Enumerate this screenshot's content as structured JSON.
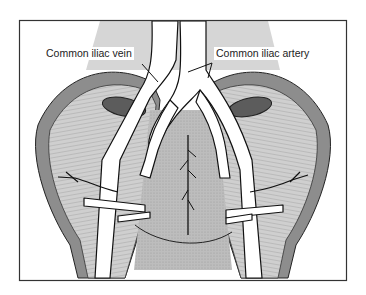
{
  "diagram": {
    "labels": {
      "vein": "Common iliac vein",
      "artery": "Common iliac artery"
    },
    "colors": {
      "frame": "#333333",
      "muscle_dark": "#8a8a8a",
      "muscle_light": "#c8c8c8",
      "background_gray": "#d4d4d4",
      "center_gray": "#b8b8b8",
      "vessel": "#ffffff",
      "outline": "#1a1a1a"
    }
  }
}
